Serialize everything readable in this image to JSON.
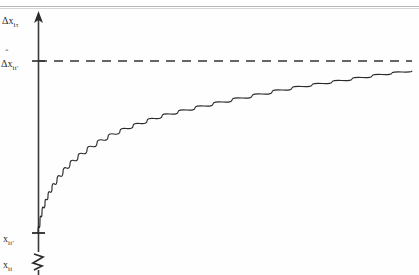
{
  "figure": {
    "title": "",
    "scan_header_text": "",
    "background_color": "#fefefe",
    "ink_color": "#2b2b2b"
  },
  "axis": {
    "name": "vertical-axis",
    "has_top_arrow": true,
    "has_bottom_break": true,
    "break_symbol": "zigzag",
    "x_px": 38,
    "top_px": 14,
    "bottom_px": 275,
    "ticks": [
      {
        "name": "tick-dxhat-itprime",
        "y_px": 61,
        "label_key": "labels.dxhat_itprime"
      },
      {
        "name": "tick-x-itprime",
        "y_px": 233,
        "label_key": "labels.x_itprime"
      }
    ]
  },
  "labels": {
    "dx_itau": {
      "base": "Δx",
      "sub": "iτ",
      "hat": false
    },
    "dxhat_itprime": {
      "base": "Δx",
      "sub": "it'",
      "hat": true,
      "hat_char": "ˆ"
    },
    "x_itprime": {
      "base": "x",
      "sub": "it'",
      "hat": false
    },
    "x_it": {
      "base": "x",
      "sub": "it",
      "hat": false
    }
  },
  "asymptote": {
    "name": "asymptote-dashed-line",
    "style": "dashed",
    "y_px": 61,
    "x_start_px": 38,
    "x_end_px": 412,
    "color": "#333333",
    "dash_pattern": "9 7",
    "stroke_width": 1.6
  },
  "curve": {
    "name": "adjustment-path-curve",
    "type": "concave-increasing-asymptotic",
    "color": "#2b2b2b",
    "stroke_width": 1.1,
    "start_point_px": {
      "x": 38,
      "y": 233
    },
    "end_point_px": {
      "x": 412,
      "y": 71
    },
    "approaches": "asymptote",
    "points_px": [
      [
        38,
        233
      ],
      [
        40,
        221
      ],
      [
        42,
        212
      ],
      [
        45,
        203
      ],
      [
        48,
        196
      ],
      [
        52,
        188
      ],
      [
        57,
        180
      ],
      [
        63,
        172
      ],
      [
        70,
        164
      ],
      [
        78,
        157
      ],
      [
        87,
        150
      ],
      [
        97,
        143
      ],
      [
        108,
        137
      ],
      [
        120,
        131
      ],
      [
        133,
        126
      ],
      [
        147,
        121
      ],
      [
        162,
        116
      ],
      [
        178,
        112
      ],
      [
        195,
        108
      ],
      [
        213,
        104
      ],
      [
        232,
        100
      ],
      [
        252,
        96
      ],
      [
        272,
        92
      ],
      [
        292,
        88
      ],
      [
        312,
        85
      ],
      [
        332,
        82
      ],
      [
        352,
        79
      ],
      [
        372,
        76
      ],
      [
        392,
        73
      ],
      [
        412,
        71
      ]
    ]
  },
  "chart_data": {
    "type": "line",
    "title": "",
    "xlabel": "",
    "ylabel": "",
    "grid": false,
    "legend": null,
    "y_tick_labels": [
      "Δx_iτ",
      "Δx̂_it'",
      "x_it'",
      "x_it"
    ],
    "x_tick_labels": [],
    "annotations": [
      {
        "text": "Δx_iτ",
        "role": "axis-top-label"
      },
      {
        "text": "Δx̂_it'",
        "role": "asymptote-level-label"
      },
      {
        "text": "x_it'",
        "role": "curve-origin-label"
      },
      {
        "text": "x_it",
        "role": "axis-break-below-label"
      }
    ],
    "series": [
      {
        "name": "adjustment-path",
        "style": "solid",
        "x": [
          0,
          0.01,
          0.02,
          0.04,
          0.06,
          0.09,
          0.13,
          0.18,
          0.23,
          0.29,
          0.36,
          0.43,
          0.51,
          0.59,
          0.67,
          0.76,
          0.84,
          0.93,
          1.0
        ],
        "y": [
          0,
          0.23,
          0.33,
          0.44,
          0.52,
          0.58,
          0.65,
          0.7,
          0.74,
          0.78,
          0.81,
          0.84,
          0.86,
          0.88,
          0.9,
          0.92,
          0.94,
          0.95,
          0.96
        ]
      },
      {
        "name": "asymptote",
        "style": "dashed",
        "x": [
          0,
          1.0
        ],
        "y": [
          1.0,
          1.0
        ]
      }
    ]
  }
}
